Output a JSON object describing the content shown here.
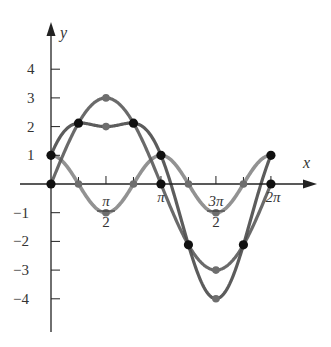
{
  "chart_data": {
    "type": "line",
    "title": "",
    "xlabel": "x",
    "ylabel": "y",
    "xlim": [
      0,
      6.2832
    ],
    "ylim": [
      -4.5,
      4.7
    ],
    "grid": false,
    "legend": null,
    "x_ticks": [
      {
        "value": 1.5708,
        "label_num": "π",
        "label_den": "2"
      },
      {
        "value": 3.1416,
        "label_num": "π",
        "label_den": ""
      },
      {
        "value": 4.7124,
        "label_num": "3π",
        "label_den": "2"
      },
      {
        "value": 6.2832,
        "label_num": "2π",
        "label_den": ""
      }
    ],
    "x_minor_ticks": [
      0.7854,
      2.3562,
      3.927,
      5.4978
    ],
    "y_ticks": [
      {
        "value": 4,
        "label": "4"
      },
      {
        "value": 3,
        "label": "3"
      },
      {
        "value": 2,
        "label": "2"
      },
      {
        "value": 1,
        "label": "1"
      },
      {
        "value": -1,
        "label": "−1"
      },
      {
        "value": -2,
        "label": "−2"
      },
      {
        "value": -3,
        "label": "−3"
      },
      {
        "value": -4,
        "label": "−4"
      }
    ],
    "series": [
      {
        "name": "y = 3 sin x",
        "color": "#5a5a5a",
        "x": [
          0,
          0.7854,
          1.5708,
          2.3562,
          3.1416,
          3.927,
          4.7124,
          5.4978,
          6.2832
        ],
        "values": [
          0,
          2.12,
          3,
          2.12,
          0,
          -2.12,
          -3,
          -2.12,
          0
        ]
      },
      {
        "name": "y = cos 2x",
        "color": "#8c8c8c",
        "x": [
          0,
          0.7854,
          1.5708,
          2.3562,
          3.1416,
          3.927,
          4.7124,
          5.4978,
          6.2832
        ],
        "values": [
          1,
          0,
          -1,
          0,
          1,
          0,
          -1,
          0,
          1
        ]
      },
      {
        "name": "y = 3 sin x + cos 2x",
        "color": "#4a4a4a",
        "x": [
          0,
          0.7854,
          1.5708,
          2.3562,
          3.1416,
          3.927,
          4.7124,
          5.4978,
          6.2832
        ],
        "values": [
          1,
          2.12,
          2,
          2.12,
          1,
          -2.12,
          -4,
          -2.12,
          1
        ]
      }
    ],
    "marked_points": {
      "black": [
        [
          0,
          0
        ],
        [
          0,
          1
        ],
        [
          0.7854,
          2.12
        ],
        [
          2.3562,
          2.12
        ],
        [
          3.1416,
          1
        ],
        [
          3.1416,
          0
        ],
        [
          3.927,
          -2.12
        ],
        [
          5.4978,
          -2.12
        ],
        [
          6.2832,
          1
        ],
        [
          6.2832,
          0
        ]
      ],
      "gray": [
        [
          1.5708,
          3
        ],
        [
          1.5708,
          2
        ],
        [
          4.7124,
          -3
        ],
        [
          4.7124,
          -4
        ],
        [
          0.7854,
          0
        ],
        [
          2.3562,
          0
        ],
        [
          3.927,
          0
        ],
        [
          5.4978,
          0
        ],
        [
          1.5708,
          -1
        ],
        [
          4.7124,
          -1
        ]
      ]
    }
  },
  "axes": {
    "x_label": "x",
    "y_label": "y"
  },
  "style": {
    "axis_color": "#222222",
    "dark_curve": "#555555",
    "light_curve": "#8c8c8c",
    "dot_black": "#111111",
    "dot_gray": "#6e6e6e"
  }
}
